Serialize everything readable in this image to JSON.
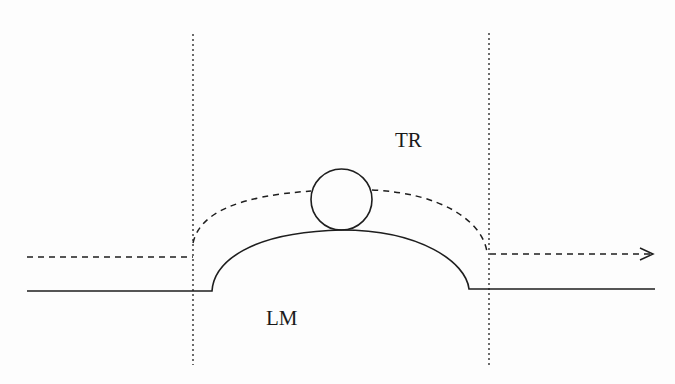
{
  "diagram": {
    "labels": {
      "top_region": "TR",
      "lower_region": "LM"
    },
    "colors": {
      "stroke": "#1e1e1e",
      "background": "#fdfdfd"
    },
    "elements": [
      {
        "name": "left-boundary",
        "style": "dotted",
        "orientation": "vertical"
      },
      {
        "name": "right-boundary",
        "style": "dotted",
        "orientation": "vertical"
      },
      {
        "name": "surface-bump",
        "style": "solid",
        "shape": "flat line with raised arc"
      },
      {
        "name": "trajectory",
        "style": "dashed",
        "shape": "incoming line, arc over particle, outgoing arrow"
      },
      {
        "name": "particle",
        "style": "solid",
        "shape": "circle"
      }
    ]
  }
}
